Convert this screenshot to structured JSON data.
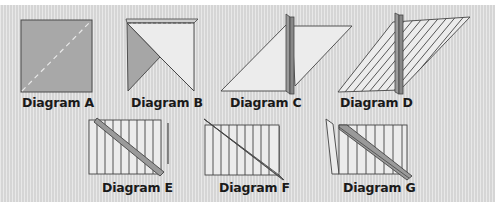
{
  "figure": {
    "background_color": "#dcdcdc",
    "fabric_colors": {
      "dark_gray": "#a6a6a6",
      "light": "#ececec",
      "stripe_band": "#8c8c8c",
      "outline": "#333333"
    },
    "diagrams": [
      {
        "id": "A",
        "label": "Diagram A"
      },
      {
        "id": "B",
        "label": "Diagram B"
      },
      {
        "id": "C",
        "label": "Diagram C"
      },
      {
        "id": "D",
        "label": "Diagram D"
      },
      {
        "id": "E",
        "label": "Diagram E"
      },
      {
        "id": "F",
        "label": "Diagram F"
      },
      {
        "id": "G",
        "label": "Diagram G"
      }
    ]
  }
}
